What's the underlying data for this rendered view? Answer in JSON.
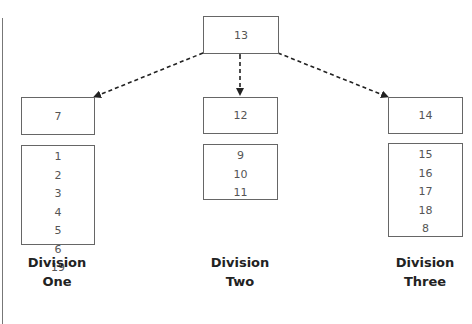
{
  "diagram": {
    "root": {
      "label": "13"
    },
    "divisions": [
      {
        "name_line1": "Division",
        "name_line2": "One",
        "head": "7",
        "members": [
          "1",
          "2",
          "3",
          "4",
          "5",
          "6",
          "19"
        ]
      },
      {
        "name_line1": "Division",
        "name_line2": "Two",
        "head": "12",
        "members": [
          "9",
          "10",
          "11"
        ]
      },
      {
        "name_line1": "Division",
        "name_line2": "Three",
        "head": "14",
        "members": [
          "15",
          "16",
          "17",
          "18",
          "8"
        ]
      }
    ],
    "connectors": [
      {
        "from": "13",
        "to": "7",
        "style": "dashed",
        "arrows": "both"
      },
      {
        "from": "13",
        "to": "12",
        "style": "dashed",
        "arrows": "both"
      },
      {
        "from": "13",
        "to": "14",
        "style": "dashed",
        "arrows": "both"
      }
    ],
    "colors": {
      "line": "#222222",
      "box_border": "#666666",
      "text": "#555555"
    }
  }
}
